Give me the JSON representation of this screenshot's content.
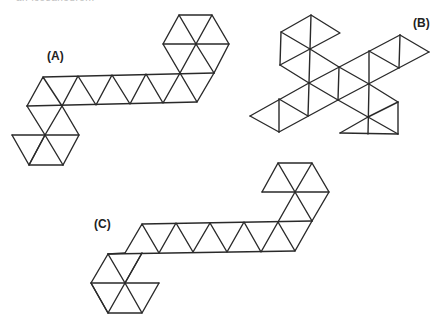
{
  "header": {
    "fragment": "an icosahedron."
  },
  "labels": {
    "a": "(A)",
    "b": "(B)",
    "c": "(C)"
  },
  "figures": [
    {
      "id": "A",
      "description": "Icosahedron net: horizontal strip of 10 triangles with a hexagonal cap of triangles at upper right and lower left",
      "triangle_count": 20
    },
    {
      "id": "B",
      "description": "Icosahedron net rotated with vertical edges, cross-like arrangement",
      "triangle_count": 20
    },
    {
      "id": "C",
      "description": "Icosahedron net: horizontal strip of 10 triangles with triangle clusters at upper right and lower left",
      "triangle_count": 20
    }
  ],
  "colors": {
    "stroke": "#2a2a2a",
    "background": "#ffffff",
    "label": "#222222"
  }
}
